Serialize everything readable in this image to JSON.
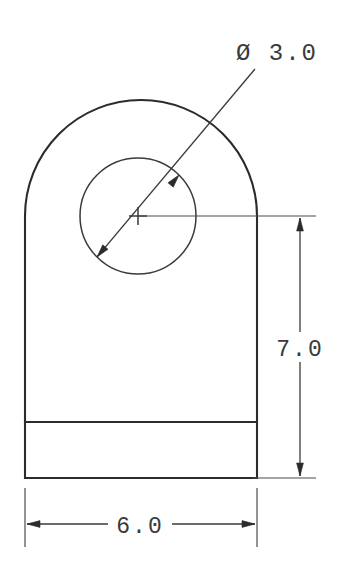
{
  "drawing": {
    "title": "Bracket Orthographic View",
    "type": "engineering-drawing",
    "background_color": "#ffffff",
    "line_color": "#2b2b2b",
    "dimensions": {
      "diameter": {
        "label": "Ø 3.0",
        "symbol": "Ø",
        "value": "3.0",
        "kind": "diameter",
        "feature": "through-hole"
      },
      "height": {
        "label": "7.0",
        "value": "7.0",
        "kind": "linear-vertical",
        "feature": "body-height"
      },
      "width": {
        "label": "6.0",
        "value": "6.0",
        "kind": "linear-horizontal",
        "feature": "body-width"
      }
    },
    "geometry": {
      "body_left_x": 25,
      "body_right_x": 257,
      "body_bottom_y": 478,
      "body_band_y": 422,
      "arc_center_x": 138,
      "arc_center_y": 216,
      "arc_radius": 116,
      "hole_center_x": 138,
      "hole_center_y": 216,
      "hole_radius": 58
    }
  }
}
